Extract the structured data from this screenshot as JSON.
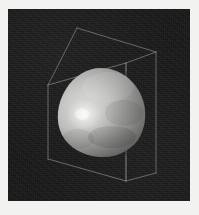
{
  "figure": {
    "kind": "3d-isosurface-render",
    "title": "",
    "caption": "",
    "background_color": "#171717",
    "page_color": "#f2f2f0",
    "viewport": {
      "x": 8,
      "y": 9,
      "width": 182,
      "height": 192
    }
  },
  "bounding_box": {
    "label": "wireframe-domain-box",
    "line_color": "#8c8c8c",
    "line_width": 0.8,
    "visible": true,
    "projection": "perspective",
    "vertices": {
      "front_top_left": [
        40,
        76
      ],
      "front_top_right": [
        118,
        54
      ],
      "front_bottom_right": [
        118,
        172
      ],
      "front_bottom_left": [
        40,
        150
      ],
      "back_top_left": [
        69,
        19
      ],
      "back_top_right": [
        148,
        43
      ],
      "back_bottom_right": [
        148,
        164
      ],
      "back_bottom_left": [
        69,
        140
      ]
    },
    "edges": [
      "front_top_left-front_top_right",
      "front_top_right-front_bottom_right",
      "front_bottom_right-front_bottom_left",
      "front_bottom_left-front_top_left",
      "back_top_left-back_top_right",
      "back_top_right-back_bottom_right",
      "front_top_left-back_top_left",
      "front_top_right-back_top_right",
      "front_bottom_right-back_bottom_right"
    ]
  },
  "isosurface": {
    "label": "shaded-blob-isosurface",
    "shading": "grayscale-diffuse-specular",
    "center": [
      93,
      103
    ],
    "radius_x": 42,
    "radius_y": 44,
    "highlight": {
      "position": [
        76,
        106
      ],
      "color": "#ededeb",
      "intensity": 1.0
    },
    "midtone_color": "#b9b9b7",
    "shadow_color": "#6e6e6c",
    "terminator_color": "#4a4a49",
    "outline_visible": false
  },
  "chart_data": {
    "type": "surface",
    "title": "",
    "xlabel": "",
    "ylabel": "",
    "zlabel": "",
    "grid": false,
    "legend": null,
    "annotations": []
  }
}
